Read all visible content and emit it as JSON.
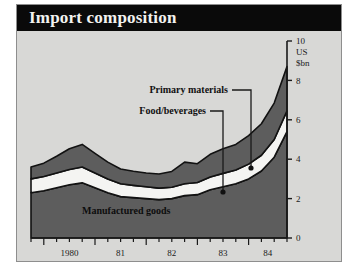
{
  "header": {
    "title": "Import composition"
  },
  "axis": {
    "unit_lines": [
      "10",
      "US",
      "$bn"
    ],
    "y_ticks": [
      "0",
      "2",
      "4",
      "6",
      "8",
      "10"
    ],
    "x_ticks": [
      "1980",
      "81",
      "82",
      "83",
      "84"
    ]
  },
  "annotations": {
    "primary_materials": "Primary materials",
    "food_beverages": "Food/beverages",
    "manufactured_goods": "Manufactured goods"
  },
  "colors": {
    "panel_background": "#d8d8d6",
    "title_background": "#0a0a0a",
    "title_text": "#f2f2f0",
    "manufactured": "#5d5d5d",
    "food": "#f4f4f2",
    "primary": "#5d5d5d",
    "outline": "#121212",
    "axis": "#1a1a1a"
  },
  "chart_data": {
    "type": "area",
    "stacked": true,
    "title": "Import composition",
    "xlabel": "",
    "ylabel": "US $bn",
    "ylim": [
      0,
      10
    ],
    "grid": false,
    "legend": "annotated-inline",
    "x": [
      "1979Q4",
      "1980Q1",
      "1980Q2",
      "1980Q3",
      "1980Q4",
      "1981Q1",
      "1981Q2",
      "1981Q3",
      "1981Q4",
      "1982Q1",
      "1982Q2",
      "1982Q3",
      "1982Q4",
      "1983Q1",
      "1983Q2",
      "1983Q3",
      "1983Q4",
      "1984Q1",
      "1984Q2",
      "1984Q3",
      "1984Q4"
    ],
    "series": [
      {
        "name": "Manufactured goods",
        "values": [
          2.3,
          2.4,
          2.55,
          2.7,
          2.8,
          2.55,
          2.3,
          2.1,
          2.05,
          2.0,
          1.95,
          2.0,
          2.15,
          2.2,
          2.45,
          2.6,
          2.75,
          3.0,
          3.4,
          4.1,
          5.4
        ]
      },
      {
        "name": "Food/beverages",
        "values": [
          0.7,
          0.72,
          0.75,
          0.78,
          0.8,
          0.75,
          0.7,
          0.65,
          0.62,
          0.6,
          0.58,
          0.58,
          0.6,
          0.62,
          0.65,
          0.68,
          0.7,
          0.75,
          0.8,
          0.9,
          1.05
        ]
      },
      {
        "name": "Primary materials",
        "values": [
          0.6,
          0.68,
          0.85,
          1.05,
          1.15,
          1.0,
          0.85,
          0.75,
          0.72,
          0.7,
          0.72,
          0.8,
          1.1,
          0.95,
          1.15,
          1.25,
          1.3,
          1.45,
          1.6,
          1.85,
          2.25
        ]
      }
    ],
    "totals": [
      3.6,
      3.8,
      4.15,
      4.53,
      4.75,
      4.3,
      3.85,
      3.5,
      3.39,
      3.3,
      3.25,
      3.38,
      3.85,
      3.77,
      4.25,
      4.53,
      4.75,
      5.2,
      5.8,
      6.85,
      8.7
    ]
  }
}
